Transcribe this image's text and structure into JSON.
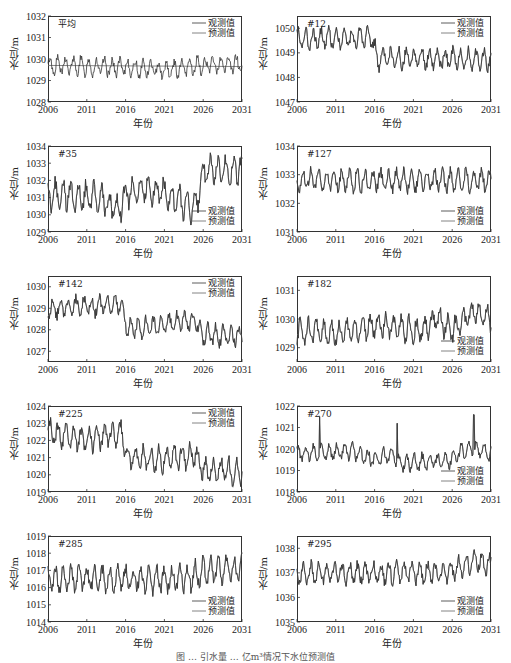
{
  "figure": {
    "caption": "图 … 引水量 … 亿m³情况下水位预测值",
    "legend": {
      "observed": "观测值",
      "predicted": "预测值"
    },
    "xlabel": "年份",
    "ylabel": "水位/m"
  },
  "chart_data": [
    {
      "type": "line",
      "title": "平均",
      "xlabel": "年份",
      "ylabel": "水位/m",
      "xlim": [
        2006,
        2031
      ],
      "ylim": [
        1028,
        1032
      ],
      "xticks": [
        2006,
        2011,
        2016,
        2021,
        2026,
        2031
      ],
      "yticks": [
        1028,
        1029,
        1030,
        1031,
        1032
      ],
      "series": [
        {
          "name": "观测值",
          "description": "monthly oscillating series around 1029.7, amplitude ~±0.5, peaks ~1030.8 in 2008 and 2029"
        },
        {
          "name": "预测值",
          "description": "near-flat line ~1029.7"
        }
      ],
      "base": 1029.7,
      "amp": 0.45,
      "trend": [
        [
          2006,
          0
        ],
        [
          2016,
          -0.1
        ],
        [
          2022,
          -0.2
        ],
        [
          2026,
          0
        ],
        [
          2031,
          0.1
        ]
      ],
      "legend_pos": "upper right"
    },
    {
      "type": "line",
      "title": "#12",
      "xlabel": "年份",
      "ylabel": "水位/m",
      "xlim": [
        2006,
        2031
      ],
      "ylim": [
        1047,
        1050.5
      ],
      "xticks": [
        2006,
        2011,
        2016,
        2021,
        2026,
        2031
      ],
      "yticks": [
        1047,
        1048,
        1049,
        1050
      ],
      "series": [
        {
          "name": "观测值"
        },
        {
          "name": "预测值"
        }
      ],
      "base": 1049.6,
      "amp": 0.45,
      "trend": [
        [
          2006,
          0
        ],
        [
          2015.7,
          0
        ],
        [
          2016.3,
          -0.85
        ],
        [
          2031,
          -0.85
        ]
      ],
      "legend_pos": "upper right"
    },
    {
      "type": "line",
      "title": "#35",
      "xlabel": "年份",
      "ylabel": "水位/m",
      "xlim": [
        2006,
        2031
      ],
      "ylim": [
        1029,
        1034
      ],
      "xticks": [
        2006,
        2011,
        2016,
        2021,
        2026,
        2031
      ],
      "yticks": [
        1029,
        1030,
        1031,
        1032,
        1033,
        1034
      ],
      "series": [
        {
          "name": "观测值"
        },
        {
          "name": "预测值"
        }
      ],
      "base": 1031.2,
      "amp": 0.9,
      "trend": [
        [
          2006,
          0
        ],
        [
          2012,
          -0.1
        ],
        [
          2015,
          -0.9
        ],
        [
          2016,
          0
        ],
        [
          2019,
          0.4
        ],
        [
          2025,
          -0.8
        ],
        [
          2026,
          1.3
        ],
        [
          2031,
          1.5
        ]
      ],
      "legend_pos": "lower right"
    },
    {
      "type": "line",
      "title": "#127",
      "xlabel": "年份",
      "ylabel": "水位/m",
      "xlim": [
        2006,
        2031
      ],
      "ylim": [
        1031,
        1034
      ],
      "xticks": [
        2006,
        2011,
        2016,
        2021,
        2026,
        2031
      ],
      "yticks": [
        1031,
        1032,
        1033,
        1034
      ],
      "series": [
        {
          "name": "观测值"
        },
        {
          "name": "预测值"
        }
      ],
      "base": 1032.8,
      "amp": 0.4,
      "trend": [
        [
          2006,
          0
        ],
        [
          2031,
          0
        ]
      ],
      "legend_pos": "lower right"
    },
    {
      "type": "line",
      "title": "#142",
      "xlabel": "年份",
      "ylabel": "水位/m",
      "xlim": [
        2006,
        2031
      ],
      "ylim": [
        1026.5,
        1030.5
      ],
      "xticks": [
        2006,
        2011,
        2016,
        2021,
        2026,
        2031
      ],
      "yticks": [
        1027,
        1028,
        1029,
        1030
      ],
      "series": [
        {
          "name": "观测值"
        },
        {
          "name": "预测值"
        }
      ],
      "base": 1029.0,
      "amp": 0.5,
      "trend": [
        [
          2006,
          0
        ],
        [
          2015.5,
          0.2
        ],
        [
          2016.3,
          -1.0
        ],
        [
          2022,
          -0.7
        ],
        [
          2025,
          -0.6
        ],
        [
          2026,
          -1.2
        ],
        [
          2031,
          -1.3
        ]
      ],
      "legend_pos": "upper right"
    },
    {
      "type": "line",
      "title": "#182",
      "xlabel": "年份",
      "ylabel": "水位/m",
      "xlim": [
        2006,
        2031
      ],
      "ylim": [
        1028.5,
        1031.5
      ],
      "xticks": [
        2006,
        2011,
        2016,
        2021,
        2026,
        2031
      ],
      "yticks": [
        1029,
        1030,
        1031
      ],
      "series": [
        {
          "name": "观测值"
        },
        {
          "name": "预测值"
        }
      ],
      "base": 1029.6,
      "amp": 0.45,
      "trend": [
        [
          2006,
          0
        ],
        [
          2012,
          -0.1
        ],
        [
          2016,
          0.2
        ],
        [
          2022,
          0
        ],
        [
          2024,
          0.4
        ],
        [
          2026,
          0
        ],
        [
          2029,
          0.7
        ],
        [
          2031,
          0.4
        ]
      ],
      "legend_pos": "lower right"
    },
    {
      "type": "line",
      "title": "#225",
      "xlabel": "年份",
      "ylabel": "水位/m",
      "xlim": [
        2006,
        2031
      ],
      "ylim": [
        1019,
        1024
      ],
      "xticks": [
        2006,
        2011,
        2016,
        2021,
        2026,
        2031
      ],
      "yticks": [
        1019,
        1020,
        1021,
        1022,
        1023,
        1024
      ],
      "series": [
        {
          "name": "观测值"
        },
        {
          "name": "预测值"
        }
      ],
      "base": 1022.5,
      "amp": 0.75,
      "trend": [
        [
          2006,
          0
        ],
        [
          2011,
          -0.5
        ],
        [
          2015.5,
          0
        ],
        [
          2016.3,
          -1.5
        ],
        [
          2021,
          -1.6
        ],
        [
          2025,
          -1.3
        ],
        [
          2026,
          -2.2
        ],
        [
          2031,
          -2.3
        ]
      ],
      "legend_pos": "upper right"
    },
    {
      "type": "line",
      "title": "#270",
      "xlabel": "年份",
      "ylabel": "水位/m",
      "xlim": [
        2006,
        2031
      ],
      "ylim": [
        1018,
        1022
      ],
      "xticks": [
        2006,
        2011,
        2016,
        2021,
        2026,
        2031
      ],
      "yticks": [
        1018,
        1019,
        1020,
        1021,
        1022
      ],
      "series": [
        {
          "name": "观测值"
        },
        {
          "name": "预测值"
        }
      ],
      "base": 1019.8,
      "amp": 0.4,
      "trend": [
        [
          2006,
          0
        ],
        [
          2013,
          0.1
        ],
        [
          2016,
          -0.3
        ],
        [
          2018.5,
          0
        ],
        [
          2019,
          -0.5
        ],
        [
          2026,
          -0.3
        ],
        [
          2028,
          0.3
        ],
        [
          2031,
          0
        ]
      ],
      "spikes": [
        [
          2008.9,
          1021.5
        ],
        [
          2018.9,
          1021.2
        ],
        [
          2028.8,
          1021.6
        ]
      ],
      "legend_pos": "lower right"
    },
    {
      "type": "line",
      "title": "#285",
      "xlabel": "年份",
      "ylabel": "水位/m",
      "xlim": [
        2006,
        2031
      ],
      "ylim": [
        1014,
        1019
      ],
      "xticks": [
        2006,
        2011,
        2016,
        2021,
        2026,
        2031
      ],
      "yticks": [
        1014,
        1015,
        1016,
        1017,
        1018,
        1019
      ],
      "series": [
        {
          "name": "观测值"
        },
        {
          "name": "预测值"
        }
      ],
      "base": 1016.5,
      "amp": 0.8,
      "trend": [
        [
          2006,
          0
        ],
        [
          2024,
          0
        ],
        [
          2026,
          0.5
        ],
        [
          2031,
          0.6
        ]
      ],
      "legend_pos": "lower right"
    },
    {
      "type": "line",
      "title": "#295",
      "xlabel": "年份",
      "ylabel": "水位/m",
      "xlim": [
        2006,
        2031
      ],
      "ylim": [
        1035,
        1038.5
      ],
      "xticks": [
        2006,
        2011,
        2016,
        2021,
        2026,
        2031
      ],
      "yticks": [
        1035,
        1036,
        1037,
        1038
      ],
      "series": [
        {
          "name": "观测值"
        },
        {
          "name": "预测值"
        }
      ],
      "base": 1037.0,
      "amp": 0.45,
      "trend": [
        [
          2006,
          0
        ],
        [
          2025,
          0
        ],
        [
          2026,
          0.1
        ],
        [
          2029,
          0.5
        ],
        [
          2031,
          0.3
        ]
      ],
      "legend_pos": "lower right"
    }
  ]
}
